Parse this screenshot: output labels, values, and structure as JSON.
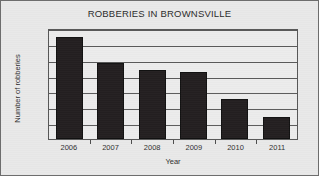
{
  "chart_data": {
    "type": "bar",
    "title": "ROBBERIES IN BROWNSVILLE",
    "xlabel": "Year",
    "ylabel": "Number of robberies",
    "categories": [
      "2006",
      "2007",
      "2008",
      "2009",
      "2010",
      "2011"
    ],
    "values": [
      129,
      96,
      87,
      85,
      50,
      28
    ],
    "ylim": [
      0,
      140
    ],
    "yticks": [
      0,
      20,
      40,
      60,
      80,
      100,
      120,
      140
    ],
    "ytick_labels": [
      "0",
      "20",
      "40",
      "60",
      "80",
      "100",
      "120",
      "140"
    ],
    "grid": "horizontal",
    "legend": "none",
    "series": [
      {
        "name": "Number of robberies",
        "values": [
          129,
          96,
          87,
          85,
          50,
          28
        ],
        "color": "#231f20"
      }
    ],
    "colors": {
      "bar": "#231f20",
      "background": "#e9e9e9",
      "plot_background": "#ececec",
      "axis": "#565656",
      "gridline": "#5a5a5a",
      "text": "#2b2b2b"
    }
  }
}
